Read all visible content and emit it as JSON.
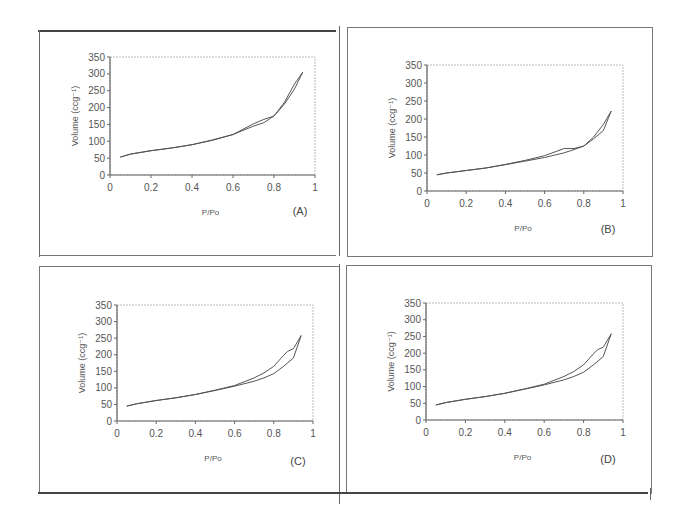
{
  "chart_data": [
    {
      "type": "line",
      "panel_label": "(A)",
      "xlabel": "P/Po",
      "ylabel": "Volume (ccg⁻¹)",
      "xlim": [
        0,
        1
      ],
      "ylim": [
        0,
        350
      ],
      "xticks": [
        "0",
        "0.2",
        "0.4",
        "0.6",
        "0.8",
        "1"
      ],
      "yticks": [
        "0",
        "50",
        "100",
        "150",
        "200",
        "250",
        "300",
        "350"
      ],
      "grid": false,
      "series": [
        {
          "name": "adsorption",
          "x": [
            0.05,
            0.1,
            0.2,
            0.3,
            0.4,
            0.5,
            0.6,
            0.7,
            0.75,
            0.8,
            0.85,
            0.9,
            0.94
          ],
          "y": [
            53,
            62,
            72,
            80,
            90,
            103,
            120,
            145,
            155,
            175,
            210,
            255,
            305
          ]
        },
        {
          "name": "desorption",
          "x": [
            0.94,
            0.9,
            0.85,
            0.8,
            0.75,
            0.7,
            0.6,
            0.5,
            0.4,
            0.3,
            0.2,
            0.1,
            0.05
          ],
          "y": [
            305,
            270,
            215,
            175,
            165,
            152,
            120,
            104,
            90,
            80,
            72,
            62,
            53
          ]
        }
      ]
    },
    {
      "type": "line",
      "panel_label": "(B)",
      "xlabel": "P/Po",
      "ylabel": "Volume (ccg⁻¹)",
      "xlim": [
        0,
        1
      ],
      "ylim": [
        0,
        350
      ],
      "xticks": [
        "0",
        "0.2",
        "0.4",
        "0.6",
        "0.8",
        "1"
      ],
      "yticks": [
        "0",
        "50",
        "100",
        "150",
        "200",
        "250",
        "300",
        "350"
      ],
      "grid": false,
      "series": [
        {
          "name": "adsorption",
          "x": [
            0.05,
            0.1,
            0.2,
            0.3,
            0.4,
            0.5,
            0.6,
            0.7,
            0.75,
            0.8,
            0.85,
            0.9,
            0.94
          ],
          "y": [
            45,
            50,
            57,
            64,
            73,
            83,
            93,
            106,
            115,
            125,
            145,
            168,
            222
          ]
        },
        {
          "name": "desorption",
          "x": [
            0.94,
            0.9,
            0.85,
            0.8,
            0.75,
            0.7,
            0.6,
            0.5,
            0.4,
            0.3,
            0.2,
            0.1,
            0.05
          ],
          "y": [
            222,
            185,
            150,
            125,
            118,
            118,
            98,
            85,
            74,
            64,
            57,
            50,
            45
          ]
        }
      ]
    },
    {
      "type": "line",
      "panel_label": "(C)",
      "xlabel": "P/Po",
      "ylabel": "Volume (ccg⁻¹)",
      "xlim": [
        0,
        1
      ],
      "ylim": [
        0,
        350
      ],
      "xticks": [
        "0",
        "0.2",
        "0.4",
        "0.6",
        "0.8",
        "1"
      ],
      "yticks": [
        "0",
        "50",
        "100",
        "150",
        "200",
        "250",
        "300",
        "350"
      ],
      "grid": false,
      "series": [
        {
          "name": "adsorption",
          "x": [
            0.05,
            0.1,
            0.2,
            0.3,
            0.4,
            0.5,
            0.6,
            0.7,
            0.75,
            0.8,
            0.85,
            0.9,
            0.94
          ],
          "y": [
            45,
            52,
            62,
            70,
            80,
            92,
            105,
            120,
            130,
            143,
            165,
            190,
            258
          ]
        },
        {
          "name": "desorption",
          "x": [
            0.94,
            0.9,
            0.87,
            0.85,
            0.8,
            0.75,
            0.7,
            0.6,
            0.5,
            0.4,
            0.3,
            0.2,
            0.1,
            0.05
          ],
          "y": [
            258,
            218,
            210,
            198,
            165,
            145,
            130,
            107,
            93,
            80,
            70,
            62,
            52,
            45
          ]
        }
      ]
    },
    {
      "type": "line",
      "panel_label": "(D)",
      "xlabel": "P/Po",
      "ylabel": "Volume (ccg⁻¹)",
      "xlim": [
        0,
        1
      ],
      "ylim": [
        0,
        350
      ],
      "xticks": [
        "0",
        "0.2",
        "0.4",
        "0.6",
        "0.8",
        "1"
      ],
      "yticks": [
        "0",
        "50",
        "100",
        "150",
        "200",
        "250",
        "300",
        "350"
      ],
      "grid": false,
      "series": [
        {
          "name": "adsorption",
          "x": [
            0.05,
            0.1,
            0.2,
            0.3,
            0.4,
            0.5,
            0.6,
            0.7,
            0.75,
            0.8,
            0.85,
            0.9,
            0.94
          ],
          "y": [
            45,
            52,
            62,
            70,
            80,
            92,
            105,
            120,
            130,
            143,
            165,
            190,
            258
          ]
        },
        {
          "name": "desorption",
          "x": [
            0.94,
            0.9,
            0.87,
            0.85,
            0.8,
            0.75,
            0.7,
            0.6,
            0.5,
            0.4,
            0.3,
            0.2,
            0.1,
            0.05
          ],
          "y": [
            258,
            218,
            210,
            198,
            165,
            145,
            130,
            107,
            93,
            80,
            70,
            62,
            52,
            45
          ]
        }
      ]
    }
  ],
  "panels": {
    "a": {
      "label": "(A)",
      "xlabel": "P/Po",
      "ylabel": "Volume (ccg⁻¹)"
    },
    "b": {
      "label": "(B)",
      "xlabel": "P/Po",
      "ylabel": "Volume (ccg⁻¹)"
    },
    "c": {
      "label": "(C)",
      "xlabel": "P/Po",
      "ylabel": "Volume (ccg⁻¹)"
    },
    "d": {
      "label": "(D)",
      "xlabel": "P/Po",
      "ylabel": "Volume (ccg⁻¹)"
    }
  },
  "colors": {
    "curve": "#555555",
    "axis": "#666666",
    "frame": "#777777"
  }
}
